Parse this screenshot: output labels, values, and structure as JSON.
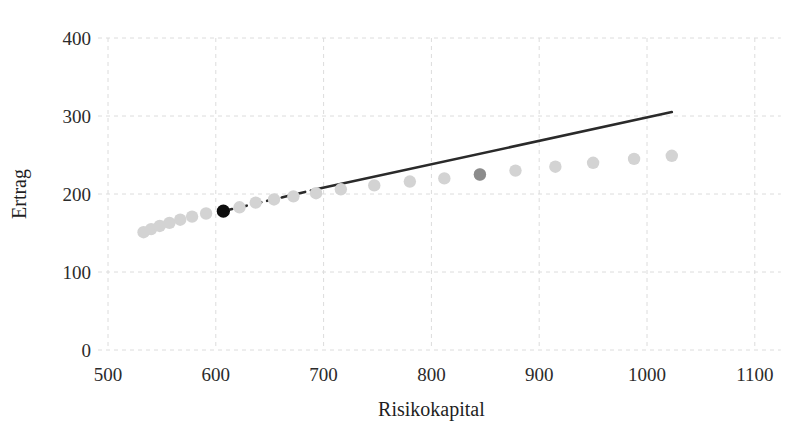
{
  "chart_data": {
    "type": "scatter",
    "title": "",
    "xlabel": "Risikokapital",
    "ylabel": "Ertrag",
    "xlim": [
      450,
      1150
    ],
    "ylim": [
      0,
      430
    ],
    "xticks": [
      500,
      600,
      700,
      800,
      900,
      1000,
      1100
    ],
    "yticks": [
      0,
      100,
      200,
      300,
      400
    ],
    "grid": true,
    "legend": "none",
    "series": [
      {
        "name": "efficient-frontier-points",
        "type": "scatter",
        "marker": "circle",
        "color": "#d3d3d3",
        "points": [
          {
            "x": 533,
            "y": 151
          },
          {
            "x": 540,
            "y": 155
          },
          {
            "x": 548,
            "y": 159
          },
          {
            "x": 557,
            "y": 163
          },
          {
            "x": 567,
            "y": 167
          },
          {
            "x": 578,
            "y": 171
          },
          {
            "x": 591,
            "y": 175
          },
          {
            "x": 607,
            "y": 178
          },
          {
            "x": 622,
            "y": 183
          },
          {
            "x": 637,
            "y": 189
          },
          {
            "x": 654,
            "y": 193
          },
          {
            "x": 672,
            "y": 197
          },
          {
            "x": 693,
            "y": 201
          },
          {
            "x": 716,
            "y": 206
          },
          {
            "x": 747,
            "y": 211
          },
          {
            "x": 780,
            "y": 216
          },
          {
            "x": 812,
            "y": 220
          },
          {
            "x": 845,
            "y": 225
          },
          {
            "x": 878,
            "y": 230
          },
          {
            "x": 915,
            "y": 235
          },
          {
            "x": 950,
            "y": 240
          },
          {
            "x": 988,
            "y": 245
          },
          {
            "x": 1023,
            "y": 249
          }
        ]
      },
      {
        "name": "selected-portfolio-dark",
        "type": "scatter",
        "marker": "circle",
        "color": "#0d0d0d",
        "points": [
          {
            "x": 607,
            "y": 178
          }
        ]
      },
      {
        "name": "reference-portfolio-gray",
        "type": "scatter",
        "marker": "circle",
        "color": "#8c8c8c",
        "points": [
          {
            "x": 845,
            "y": 225
          }
        ]
      },
      {
        "name": "tangent-line-dashed",
        "type": "line",
        "style": "dashed",
        "color": "#2a2a2a",
        "points": [
          {
            "x": 607,
            "y": 178
          },
          {
            "x": 693,
            "y": 206
          }
        ]
      },
      {
        "name": "tangent-line-solid",
        "type": "line",
        "style": "solid",
        "color": "#2a2a2a",
        "points": [
          {
            "x": 693,
            "y": 206
          },
          {
            "x": 1023,
            "y": 305
          }
        ]
      }
    ]
  },
  "axes": {
    "x": {
      "title": "Risikokapital",
      "tick_labels": [
        "500",
        "600",
        "700",
        "800",
        "900",
        "1000",
        "1100"
      ]
    },
    "y": {
      "title": "Ertrag",
      "tick_labels": [
        "0",
        "100",
        "200",
        "300",
        "400"
      ]
    }
  },
  "colors": {
    "background": "#ffffff",
    "grid": "#dcdcdc",
    "point_light": "#d3d3d3",
    "point_mid": "#8c8c8c",
    "point_dark": "#0d0d0d",
    "line": "#2a2a2a",
    "text": "#231f20"
  }
}
